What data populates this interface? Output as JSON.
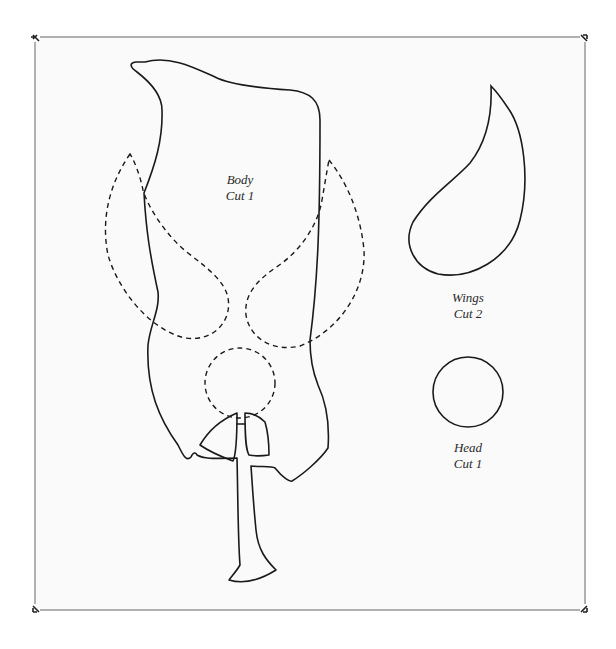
{
  "pattern": {
    "pieces": [
      {
        "id": "body",
        "name": "Body",
        "cut": "Cut 1"
      },
      {
        "id": "wings",
        "name": "Wings",
        "cut": "Cut 2"
      },
      {
        "id": "head",
        "name": "Head",
        "cut": "Cut 1"
      }
    ],
    "colors": {
      "paper": "#fafafa",
      "line": "#1a1a1a",
      "frame": "#555555"
    }
  }
}
